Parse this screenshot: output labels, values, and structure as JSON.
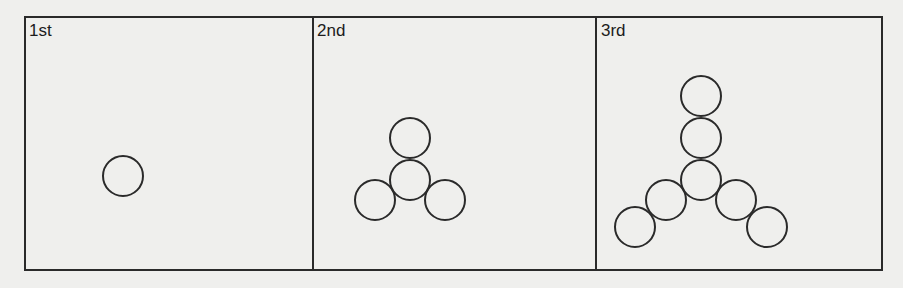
{
  "panels": [
    {
      "label": "1st",
      "circle_count": 1
    },
    {
      "label": "2nd",
      "circle_count": 4
    },
    {
      "label": "3rd",
      "circle_count": 7
    }
  ],
  "colors": {
    "stroke": "#2a2a2a",
    "background": "#efefed"
  }
}
